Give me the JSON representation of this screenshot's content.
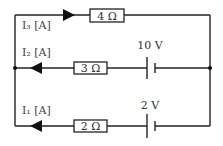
{
  "diagram": {
    "type": "circuit",
    "branches": [
      {
        "id": "top",
        "current_label": "I₃ [A]",
        "resistor": "4 Ω",
        "battery": null,
        "arrow_direction": "right"
      },
      {
        "id": "middle",
        "current_label": "I₂ [A]",
        "resistor": "3 Ω",
        "battery": "10 V",
        "arrow_direction": "left"
      },
      {
        "id": "bottom",
        "current_label": "I₁ [A]",
        "resistor": "2 Ω",
        "battery": "2 V",
        "arrow_direction": "left"
      }
    ],
    "labels": {
      "i3": "I₃ [A]",
      "i2": "I₂ [A]",
      "i1": "I₁ [A]",
      "r_top": "4 Ω",
      "r_mid": "3 Ω",
      "r_bot": "2 Ω",
      "v_mid": "10 V",
      "v_bot": "2 V"
    }
  }
}
